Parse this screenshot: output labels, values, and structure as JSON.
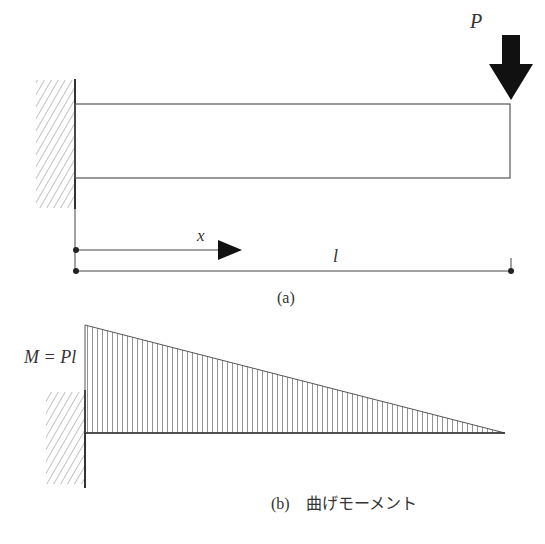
{
  "figure_a": {
    "load_label": "P",
    "x_label": "x",
    "length_label": "l",
    "caption": "(a)"
  },
  "figure_b": {
    "moment_label": "M = Pl",
    "caption": "(b)　曲げモーメント"
  },
  "colors": {
    "line": "#444444",
    "hatch": "#999999",
    "arrow": "#111111",
    "text": "#333333"
  }
}
